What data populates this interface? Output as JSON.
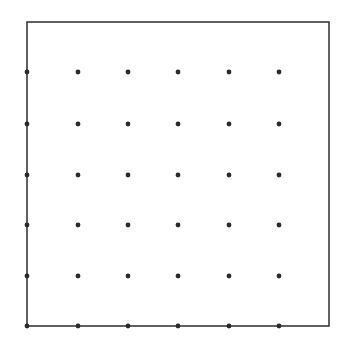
{
  "diagram": {
    "type": "dot-lattice-in-square",
    "frame": {
      "x": 27,
      "y": 22,
      "width": 302,
      "height": 304,
      "stroke": "#3a3a3a",
      "stroke_width": 1.6
    },
    "dots": {
      "columns_x": [
        27,
        78,
        128,
        178,
        229,
        279
      ],
      "rows_y": [
        72,
        124,
        175,
        225,
        276,
        326
      ],
      "radius": 2.4,
      "fill": "#2a2a2a",
      "count": 36
    },
    "background": "#ffffff"
  }
}
